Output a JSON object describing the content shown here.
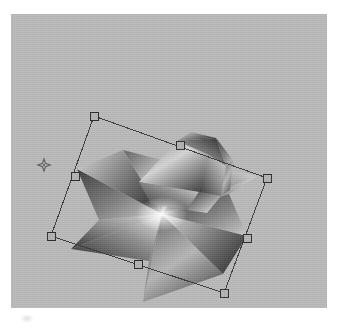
{
  "app": {
    "title": "3D Viewport",
    "document_name": "Untitled"
  },
  "viewport": {
    "name": "perspective-viewport",
    "background_color": "#b8b8b8",
    "width_px": 316,
    "height_px": 294
  },
  "selection": {
    "label": "Selected object",
    "object_name": "Faceted star polyhedron",
    "bounding_box_rotated": true,
    "rotation_deg": -22,
    "handle_count": 8,
    "handle_fill": "#b0b0b0",
    "handle_stroke": "#2b2b2b",
    "outline_color": "#3a3a3a",
    "handles": [
      {
        "name": "handle-top-left",
        "x": 83,
        "y": 102
      },
      {
        "name": "handle-top-center",
        "x": 169,
        "y": 131
      },
      {
        "name": "handle-top-right",
        "x": 256,
        "y": 164
      },
      {
        "name": "handle-middle-left",
        "x": 64,
        "y": 162
      },
      {
        "name": "handle-middle-right",
        "x": 236,
        "y": 224
      },
      {
        "name": "handle-bottom-left",
        "x": 40,
        "y": 222
      },
      {
        "name": "handle-bottom-center",
        "x": 127,
        "y": 250
      },
      {
        "name": "handle-bottom-right",
        "x": 213,
        "y": 279
      }
    ]
  },
  "pivot": {
    "name": "pivot-marker",
    "label": "Transform pivot",
    "x": 33,
    "y": 151,
    "color": "#5a5a5a"
  },
  "object": {
    "name": "star-polyhedron",
    "shading": "flat-faceted-gradient",
    "facet_count": 16,
    "highlight_color": "#f2f2f2",
    "shadow_color": "#2d2d2d",
    "midtone_color": "#8d8d8d",
    "center_highlight": {
      "x": 151,
      "y": 200
    }
  }
}
